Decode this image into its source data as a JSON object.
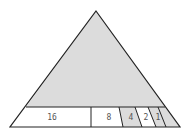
{
  "diagram": {
    "type": "subdivided-triangle",
    "colors": {
      "fill_gray": "#dcdcdc",
      "fill_white": "#ffffff",
      "stroke": "#222222",
      "label": "#555555"
    },
    "segments": [
      {
        "label": "16",
        "fill": "white"
      },
      {
        "label": "8",
        "fill": "white"
      },
      {
        "label": "4",
        "fill": "gray"
      },
      {
        "label": "2",
        "fill": "white"
      },
      {
        "label": "1",
        "fill": "gray"
      },
      {
        "label": "",
        "fill": "gray"
      }
    ]
  }
}
